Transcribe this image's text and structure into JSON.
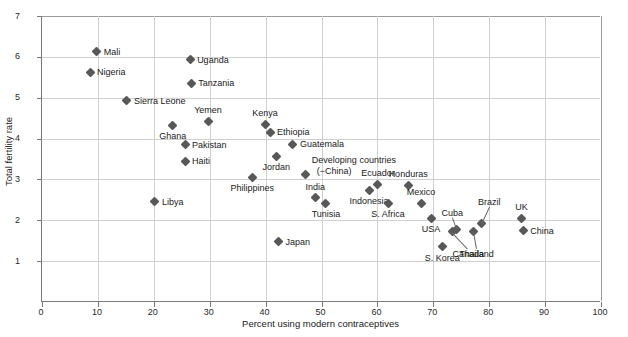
{
  "chart_data": {
    "type": "scatter",
    "title": "",
    "xlabel": "Percent using modern contraceptives",
    "ylabel": "Total fertility rate",
    "xlim": [
      0,
      100
    ],
    "ylim": [
      0,
      7
    ],
    "xticks": [
      0,
      10,
      20,
      30,
      40,
      50,
      60,
      70,
      80,
      90,
      100
    ],
    "yticks": [
      1,
      2,
      3,
      4,
      5,
      6,
      7
    ],
    "grid": true,
    "legend": "none",
    "marker_color": "#585858",
    "marker_shape": "diamond",
    "points": [
      {
        "name": "Mali",
        "x": 9.8,
        "y": 6.12,
        "label_pos": "right"
      },
      {
        "name": "Nigeria",
        "x": 8.6,
        "y": 5.62,
        "label_pos": "right"
      },
      {
        "name": "Uganda",
        "x": 26.5,
        "y": 5.93,
        "label_pos": "right"
      },
      {
        "name": "Tanzania",
        "x": 26.7,
        "y": 5.35,
        "label_pos": "right"
      },
      {
        "name": "Sierra Leone",
        "x": 15.2,
        "y": 4.92,
        "label_pos": "right"
      },
      {
        "name": "Yemen",
        "x": 29.7,
        "y": 4.43,
        "label_pos": "above"
      },
      {
        "name": "Kenya",
        "x": 39.9,
        "y": 4.35,
        "label_pos": "above"
      },
      {
        "name": "Ghana",
        "x": 23.4,
        "y": 4.33,
        "label_pos": "below"
      },
      {
        "name": "Ethiopia",
        "x": 40.8,
        "y": 4.15,
        "label_pos": "right"
      },
      {
        "name": "Pakistan",
        "x": 25.6,
        "y": 3.85,
        "label_pos": "right"
      },
      {
        "name": "Guatemala",
        "x": 44.9,
        "y": 3.86,
        "label_pos": "right"
      },
      {
        "name": "Haiti",
        "x": 25.6,
        "y": 3.45,
        "label_pos": "right"
      },
      {
        "name": "Jordan",
        "x": 41.9,
        "y": 3.57,
        "label_pos": "below"
      },
      {
        "name": "Philippines",
        "x": 37.6,
        "y": 3.05,
        "label_pos": "below"
      },
      {
        "name": "Developing countries (−China)",
        "x": 47.2,
        "y": 3.12,
        "label_pos": "above-right"
      },
      {
        "name": "Ecuador",
        "x": 60.1,
        "y": 2.88,
        "label_pos": "above"
      },
      {
        "name": "Honduras",
        "x": 65.5,
        "y": 2.86,
        "label_pos": "above"
      },
      {
        "name": "India",
        "x": 48.9,
        "y": 2.55,
        "label_pos": "above"
      },
      {
        "name": "Indonesia",
        "x": 58.5,
        "y": 2.73,
        "label_pos": "below"
      },
      {
        "name": "Tunisia",
        "x": 50.8,
        "y": 2.42,
        "label_pos": "below"
      },
      {
        "name": "S. Africa",
        "x": 61.9,
        "y": 2.42,
        "label_pos": "below"
      },
      {
        "name": "Mexico",
        "x": 67.8,
        "y": 2.42,
        "label_pos": "above"
      },
      {
        "name": "Libya",
        "x": 20.2,
        "y": 2.45,
        "label_pos": "right"
      },
      {
        "name": "USA",
        "x": 69.6,
        "y": 2.05,
        "label_pos": "below"
      },
      {
        "name": "Japan",
        "x": 42.3,
        "y": 1.47,
        "label_pos": "right"
      },
      {
        "name": "Cuba",
        "x": 74.1,
        "y": 1.78,
        "label_pos": "leader-above-left"
      },
      {
        "name": "Canada",
        "x": 73.4,
        "y": 1.72,
        "label_pos": "leader-below"
      },
      {
        "name": "Brazil",
        "x": 78.6,
        "y": 1.92,
        "label_pos": "leader-above"
      },
      {
        "name": "Thailand",
        "x": 77.2,
        "y": 1.72,
        "label_pos": "leader-below"
      },
      {
        "name": "UK",
        "x": 85.8,
        "y": 2.05,
        "label_pos": "above"
      },
      {
        "name": "China",
        "x": 86.1,
        "y": 1.75,
        "label_pos": "right"
      },
      {
        "name": "S. Korea",
        "x": 71.6,
        "y": 1.35,
        "label_pos": "below"
      }
    ],
    "annotations": [
      {
        "text": "Developing countries",
        "note": "two-line label"
      },
      {
        "text": "(−China)",
        "note": "second line of developing-countries label"
      }
    ]
  }
}
